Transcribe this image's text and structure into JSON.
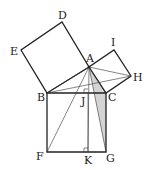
{
  "diagram": {
    "labels": {
      "A": "A",
      "B": "B",
      "C": "C",
      "D": "D",
      "E": "E",
      "F": "F",
      "G": "G",
      "H": "H",
      "I": "I",
      "J": "J",
      "K": "K"
    },
    "points": {
      "A": [
        89,
        67
      ],
      "B": [
        47,
        93
      ],
      "C": [
        106,
        93
      ],
      "D": [
        62,
        22
      ],
      "E": [
        21,
        50
      ],
      "F": [
        47,
        152
      ],
      "G": [
        106,
        152
      ],
      "H": [
        131,
        76
      ],
      "I": [
        114,
        50
      ],
      "J": [
        88,
        93
      ],
      "K": [
        88,
        152
      ]
    },
    "shaded_triangle": [
      "A",
      "C",
      "G"
    ],
    "shade_color": "#d4d4d4",
    "line_color": "#222222"
  }
}
